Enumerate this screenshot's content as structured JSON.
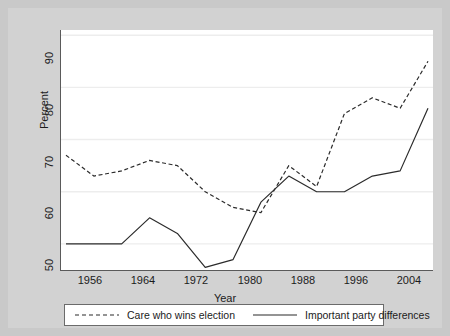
{
  "chart_data": {
    "type": "line",
    "title": "",
    "xlabel": "Year",
    "ylabel": "Percent",
    "xlim": [
      1952,
      2004
    ],
    "ylim": [
      45,
      91
    ],
    "grid": true,
    "legend_position": "bottom",
    "x": [
      1952,
      1956,
      1960,
      1964,
      1968,
      1972,
      1976,
      1980,
      1984,
      1988,
      1992,
      1996,
      2000,
      2004
    ],
    "xticks": [
      1956,
      1964,
      1972,
      1980,
      1988,
      1996,
      2004
    ],
    "xtick_labels": [
      "1956",
      "1964",
      "1972",
      "1980",
      "1988",
      "1996",
      "2004"
    ],
    "yticks": [
      50,
      60,
      70,
      80,
      90
    ],
    "ytick_labels": [
      "50",
      "60",
      "70",
      "80",
      "90"
    ],
    "series": [
      {
        "name": "Care who wins election",
        "style": "dashed",
        "color": "#2b2b2b",
        "values": [
          67,
          63,
          64,
          66,
          65,
          60,
          57,
          56,
          65,
          61,
          75,
          78,
          76,
          85
        ]
      },
      {
        "name": "Important party differences",
        "style": "solid",
        "color": "#2b2b2b",
        "values": [
          50,
          50,
          50,
          55,
          52,
          45.5,
          47,
          58,
          63,
          60,
          60,
          63,
          64,
          76
        ]
      }
    ]
  },
  "axes": {
    "y_title": "Percent",
    "x_title": "Year"
  },
  "legend": {
    "entries": [
      {
        "label": "Care who wins election",
        "style": "dashed"
      },
      {
        "label": "Important party differences",
        "style": "solid"
      }
    ]
  },
  "colors": {
    "background": "#c9c9c9",
    "figure": "#d2d2d2",
    "plot": "#ffffff",
    "axis": "#5a5a5a",
    "grid": "#ededed",
    "line": "#2b2b2b",
    "text": "#1b1b1b"
  }
}
